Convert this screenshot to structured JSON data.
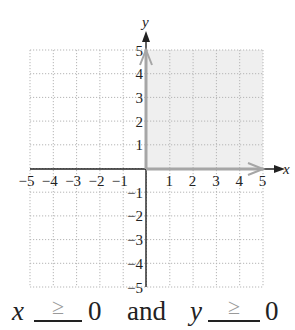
{
  "figure": {
    "x_axis_label": "x",
    "y_axis_label": "y",
    "x_ticks": [
      "-5",
      "-4",
      "-3",
      "-2",
      "-1",
      "1",
      "2",
      "3",
      "4",
      "5"
    ],
    "y_ticks": [
      "5",
      "4",
      "3",
      "2",
      "1",
      "-1",
      "-2",
      "-3",
      "-4",
      "-5"
    ],
    "shaded_region": "quadrant I (x ≥ 0, y ≥ 0)",
    "colors": {
      "shade": "#efefef",
      "boundary": "#a6a6a6",
      "axis": "#222222",
      "grid": "#b5b5b5"
    }
  },
  "caption": {
    "x_var": "x",
    "x_answer": "≥",
    "x_value": "0",
    "connector": "and",
    "y_var": "y",
    "y_answer": "≥",
    "y_value": "0"
  },
  "chart_data": {
    "type": "area",
    "title": "",
    "xlabel": "x",
    "ylabel": "y",
    "xlim": [
      -5,
      5
    ],
    "ylim": [
      -5,
      5
    ],
    "grid": true,
    "regions": [
      {
        "name": "solution",
        "condition": "x >= 0 and y >= 0",
        "x": [
          0,
          5
        ],
        "y": [
          0,
          5
        ]
      }
    ],
    "boundaries": [
      {
        "line": "x = 0",
        "from": [
          0,
          0
        ],
        "to": [
          0,
          5
        ],
        "arrow": true
      },
      {
        "line": "y = 0",
        "from": [
          0,
          0
        ],
        "to": [
          5,
          0
        ],
        "arrow": true
      }
    ]
  }
}
